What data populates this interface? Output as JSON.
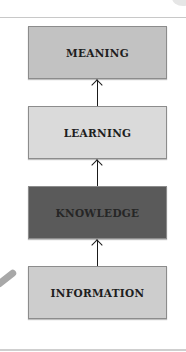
{
  "diagram": {
    "title": "",
    "boxes": [
      {
        "id": "meaning",
        "label": "MEANING",
        "color": "#c2c2c2"
      },
      {
        "id": "learning",
        "label": "LEARNING",
        "color": "#dadada"
      },
      {
        "id": "knowledge",
        "label": "KNOWLEDGE",
        "color": "#5a5a5a"
      },
      {
        "id": "information",
        "label": "INFORMATION",
        "color": "#cdcdcd"
      }
    ],
    "edges": [
      {
        "from": "information",
        "to": "knowledge"
      },
      {
        "from": "knowledge",
        "to": "learning"
      },
      {
        "from": "learning",
        "to": "meaning"
      }
    ]
  }
}
